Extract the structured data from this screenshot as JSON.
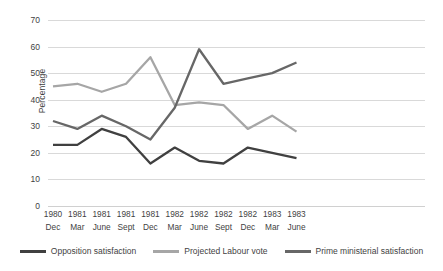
{
  "chart_data": {
    "type": "line",
    "title": "",
    "xlabel": "",
    "ylabel": "Percentage",
    "ylim": [
      0,
      70
    ],
    "yticks": [
      0,
      10,
      20,
      30,
      40,
      50,
      60,
      70
    ],
    "grid": true,
    "legend_position": "bottom",
    "categories": [
      "1980 Dec",
      "1981 Mar",
      "1981 June",
      "1981 Sept",
      "1981 Dec",
      "1982 Mar",
      "1982 June",
      "1982 Sept",
      "1982 Dec",
      "1983 Mar",
      "1983 June"
    ],
    "category_years": [
      "1980",
      "1981",
      "1981",
      "1981",
      "1981",
      "1982",
      "1982",
      "1982",
      "1982",
      "1983",
      "1983"
    ],
    "category_months": [
      "Dec",
      "Mar",
      "June",
      "Sept",
      "Dec",
      "Mar",
      "June",
      "Sept",
      "Dec",
      "Mar",
      "June"
    ],
    "series": [
      {
        "name": "Opposition satisfaction",
        "color": "#404040",
        "values": [
          23,
          23,
          29,
          26,
          16,
          22,
          17,
          16,
          22,
          20,
          18
        ]
      },
      {
        "name": "Projected Labour vote",
        "color": "#a6a6a6",
        "values": [
          45,
          46,
          43,
          46,
          56,
          38,
          39,
          38,
          29,
          34,
          28
        ]
      },
      {
        "name": "Prime ministerial satisfaction",
        "color": "#676767",
        "values": [
          32,
          29,
          34,
          30,
          25,
          37,
          59,
          46,
          48,
          50,
          54
        ]
      }
    ]
  },
  "axis": {
    "y_title": "Percentage"
  }
}
